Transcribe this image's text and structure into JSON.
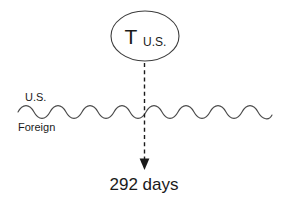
{
  "diagram": {
    "type": "tax-residency-timeline-diagram",
    "node": {
      "shape": "ellipse",
      "main_label": "T",
      "sub_label": "U.S."
    },
    "boundary": {
      "shape": "wavy-line",
      "above_label": "U.S.",
      "below_label": "Foreign"
    },
    "arrow": {
      "style": "dashed-down-arrow",
      "label": "292 days"
    },
    "colors": {
      "stroke": "#3d3d3d",
      "wave": "#4a4a4a",
      "arrow": "#1a1a1a",
      "text": "#1a1a1a",
      "background": "#ffffff"
    }
  }
}
